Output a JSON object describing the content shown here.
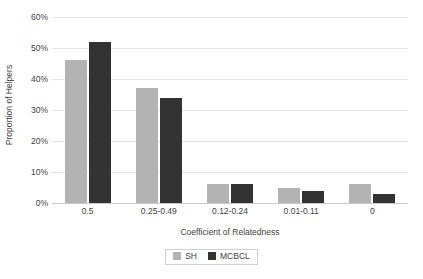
{
  "chart_data": {
    "type": "bar",
    "title": "",
    "xlabel": "Coefficient of Relatedness",
    "ylabel": "Proportion of Helpers",
    "categories": [
      "0.5",
      "0.25-0.49",
      "0.12-0.24",
      "0.01-0.11",
      "0"
    ],
    "series": [
      {
        "name": "SH",
        "color": "#b3b3b3",
        "values": [
          46,
          37,
          6,
          5,
          6
        ]
      },
      {
        "name": "MCBCL",
        "color": "#333333",
        "values": [
          52,
          34,
          6,
          4,
          3
        ]
      }
    ],
    "ylim": [
      0,
      60
    ],
    "ytick_values": [
      0,
      10,
      20,
      30,
      40,
      50,
      60
    ],
    "ytick_labels": [
      "0%",
      "10%",
      "20%",
      "30%",
      "40%",
      "50%",
      "60%"
    ],
    "grid": "horizontal",
    "legend_position": "bottom-center",
    "legend_entries": [
      "SH",
      "MCBCL"
    ]
  },
  "colors": {
    "series_sh": "#b3b3b3",
    "series_mcbcl": "#333333",
    "gridline": "#e4e4e4",
    "axis": "#c9c9c9",
    "text": "#3f3f3f",
    "background": "#ffffff"
  }
}
